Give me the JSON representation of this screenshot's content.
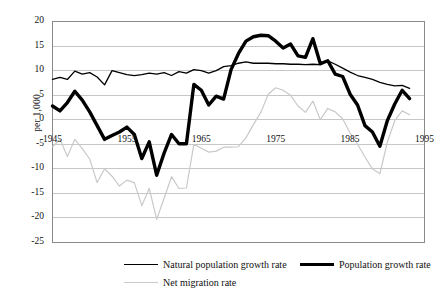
{
  "chart_data": {
    "type": "line",
    "title": "",
    "subtitle": "",
    "xlabel": "",
    "ylabel": "per 1,000",
    "xlim": [
      1945,
      1995
    ],
    "ylim": [
      -25,
      20
    ],
    "yticks": [
      20,
      15,
      10,
      5,
      0,
      -5,
      -10,
      -15,
      -20,
      -25
    ],
    "xticks": [
      1945,
      1955,
      1965,
      1975,
      1985,
      1995
    ],
    "grid": "horizontal",
    "legend_position": "bottom",
    "x": [
      1945,
      1946,
      1947,
      1948,
      1949,
      1950,
      1951,
      1952,
      1953,
      1954,
      1955,
      1956,
      1957,
      1958,
      1959,
      1960,
      1961,
      1962,
      1963,
      1964,
      1965,
      1966,
      1967,
      1968,
      1969,
      1970,
      1971,
      1972,
      1973,
      1974,
      1975,
      1976,
      1977,
      1978,
      1979,
      1980,
      1981,
      1982,
      1983,
      1984,
      1985,
      1986,
      1987,
      1988,
      1989,
      1990,
      1991,
      1992,
      1993
    ],
    "series": [
      {
        "name": "Natural population growth rate",
        "color": "#000000",
        "width": 1.3,
        "values": [
          8.2,
          8.6,
          8.2,
          9.9,
          9.3,
          9.6,
          8.7,
          7.1,
          10.0,
          9.6,
          9.2,
          9.0,
          9.2,
          9.5,
          9.3,
          9.6,
          9.0,
          9.8,
          9.5,
          10.2,
          10.0,
          9.5,
          10.0,
          10.8,
          11.0,
          11.5,
          11.8,
          11.5,
          11.5,
          11.5,
          11.4,
          11.4,
          11.3,
          11.3,
          11.2,
          11.3,
          11.2,
          12.0,
          11.3,
          10.5,
          9.7,
          9.0,
          8.6,
          8.2,
          7.6,
          7.2,
          6.9,
          7.0,
          6.4
        ]
      },
      {
        "name": "Population growth rate",
        "color": "#000000",
        "width": 3.4,
        "values": [
          2.8,
          1.8,
          3.5,
          5.8,
          4.0,
          1.6,
          -1.2,
          -4.0,
          -3.2,
          -2.5,
          -1.5,
          -3.0,
          -7.9,
          -4.5,
          -11.3,
          -6.8,
          -3.0,
          -4.9,
          -4.9,
          7.2,
          6.0,
          3.0,
          4.8,
          4.2,
          10.2,
          13.5,
          16.0,
          16.9,
          17.2,
          17.1,
          16.0,
          14.6,
          15.4,
          13.0,
          12.7,
          16.5,
          11.4,
          12.0,
          9.3,
          8.8,
          5.2,
          3.0,
          -1.2,
          -2.5,
          -5.4,
          -0.2,
          3.2,
          6.0,
          4.3
        ]
      },
      {
        "name": "Net migration rate",
        "color": "#c9c9c9",
        "width": 1.2,
        "values": [
          -5.5,
          -4.0,
          -7.5,
          -4.0,
          -5.9,
          -8.0,
          -12.8,
          -10.0,
          -11.5,
          -13.5,
          -12.3,
          -12.8,
          -17.5,
          -14.0,
          -20.3,
          -16.0,
          -11.6,
          -14.0,
          -13.9,
          -5.0,
          -5.8,
          -6.6,
          -6.4,
          -5.6,
          -5.6,
          -5.5,
          -3.7,
          -1.0,
          1.5,
          5.2,
          6.5,
          6.0,
          5.0,
          2.8,
          1.5,
          3.8,
          0.0,
          2.3,
          1.6,
          0.2,
          -2.7,
          -5.0,
          -7.6,
          -10.0,
          -11.0,
          -4.6,
          -0.2,
          1.8,
          1.0
        ]
      }
    ]
  },
  "axis": {
    "ylabel": "per 1,000",
    "yticks": [
      "20",
      "15",
      "10",
      "5",
      "0",
      "-5",
      "-10",
      "-15",
      "-20",
      "-25"
    ],
    "xticks": [
      "1945",
      "1955",
      "1965",
      "1975",
      "1985",
      "1995"
    ]
  },
  "legend": {
    "items": [
      {
        "label": "Natural population growth rate",
        "swatch": "thin-black-line"
      },
      {
        "label": "Population growth rate",
        "swatch": "thick-black-line"
      },
      {
        "label": "Net migration rate",
        "swatch": "thin-gray-line"
      }
    ]
  }
}
